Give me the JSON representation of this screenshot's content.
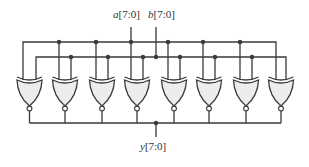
{
  "diagram": {
    "gate_type": "XNOR",
    "gate_count": 8,
    "labels": {
      "a_name": "a",
      "a_range": "[7:0]",
      "b_name": "b",
      "b_range": "[7:0]",
      "y_name": "y",
      "y_range": "[7:0]"
    },
    "colors": {
      "line": "#3a3a3a",
      "gate_fill": "#ececec"
    }
  }
}
